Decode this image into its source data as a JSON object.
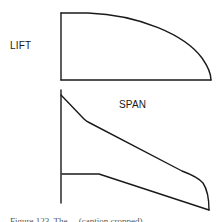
{
  "figure": {
    "type": "lift-distribution-and-planform-diagram",
    "labels": {
      "lift": "LIFT",
      "span": "SPAN"
    },
    "caption": "Figure 123. The ... (caption cropped)",
    "line_color": "#1a1a1a",
    "background_color": "#ffffff"
  },
  "lift_distribution": {
    "description": "Elliptical-like spanwise lift distribution curve over baseline",
    "shape": "quarter-ellipse bounded by root axis and span axis"
  },
  "wing_planform": {
    "description": "Half-wing planform with swept leading edge and tapered trailing edge, rounded tip",
    "root_axis": "vertical line at wing root",
    "leading_edge": "swept straight line with rounded tip",
    "trailing_edge": "short straight inboard section then tapered to tip"
  }
}
